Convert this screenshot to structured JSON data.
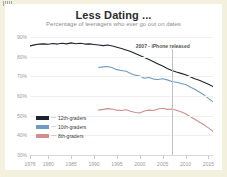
{
  "page": {
    "background": "#f3f1dd",
    "card_background": "#ffffff"
  },
  "header": {
    "title": "Less Dating ...",
    "subtitle": "Percentage of teenagers who ever go out on dates"
  },
  "annotation": {
    "text": "2007 - iPhone released",
    "year": 2007
  },
  "legend": {
    "dash": "—",
    "items": [
      {
        "label": "12th-graders",
        "color": "#1c2230"
      },
      {
        "label": "10th-graders",
        "color": "#6f9cc0"
      },
      {
        "label": "8th-graders",
        "color": "#cf8f8a"
      }
    ]
  },
  "chart_data": {
    "type": "line",
    "title": "Less Dating ...",
    "subtitle": "Percentage of teenagers who ever go out on dates",
    "xlabel": "",
    "ylabel": "",
    "xlim": [
      1976,
      2016
    ],
    "ylim": [
      30,
      90
    ],
    "grid": true,
    "legend_position": "inside-lower-left",
    "ytick_labels": [
      "90%",
      "80%",
      "70%",
      "60%",
      "50%",
      "40%",
      "30%"
    ],
    "ytick_values": [
      90,
      80,
      70,
      60,
      50,
      40,
      30
    ],
    "xtick_labels": [
      "1976",
      "1980",
      "1985",
      "1990",
      "1995",
      "2000",
      "2005",
      "2010",
      "2015"
    ],
    "xtick_values": [
      1976,
      1980,
      1985,
      1990,
      1995,
      2000,
      2005,
      2010,
      2015
    ],
    "annotations": [
      {
        "text": "2007 - iPhone released",
        "x": 2007,
        "type": "vline"
      }
    ],
    "series": [
      {
        "name": "12th-graders",
        "color": "#1c2230",
        "x": [
          1976,
          1977,
          1978,
          1979,
          1980,
          1981,
          1982,
          1983,
          1984,
          1985,
          1986,
          1987,
          1988,
          1989,
          1990,
          1991,
          1992,
          1993,
          1994,
          1995,
          1996,
          1997,
          1998,
          1999,
          2000,
          2001,
          2002,
          2003,
          2004,
          2005,
          2006,
          2007,
          2008,
          2009,
          2010,
          2011,
          2012,
          2013,
          2014,
          2015,
          2016
        ],
        "values": [
          85.5,
          86.0,
          86.4,
          86.5,
          86.3,
          86.7,
          86.4,
          86.8,
          86.5,
          87.0,
          86.6,
          86.8,
          86.4,
          86.5,
          86.2,
          85.9,
          85.6,
          85.9,
          85.4,
          84.8,
          84.2,
          83.4,
          82.6,
          81.6,
          80.6,
          79.6,
          78.5,
          77.4,
          76.3,
          75.2,
          74.0,
          73.0,
          72.2,
          71.5,
          70.8,
          69.8,
          68.8,
          68.0,
          67.0,
          66.0,
          64.8
        ]
      },
      {
        "name": "10th-graders",
        "color": "#6f9cc0",
        "x": [
          1991,
          1992,
          1993,
          1994,
          1995,
          1996,
          1997,
          1998,
          1999,
          2000,
          2001,
          2002,
          2003,
          2004,
          2005,
          2006,
          2007,
          2008,
          2009,
          2010,
          2011,
          2012,
          2013,
          2014,
          2015,
          2016
        ],
        "values": [
          74.5,
          74.8,
          75.0,
          74.4,
          73.4,
          73.0,
          72.6,
          71.4,
          70.6,
          70.2,
          69.0,
          69.4,
          68.6,
          68.4,
          68.8,
          68.2,
          67.4,
          67.0,
          66.4,
          65.8,
          64.6,
          63.4,
          62.0,
          60.6,
          58.8,
          57.0
        ]
      },
      {
        "name": "8th-graders",
        "color": "#cf8f8a",
        "x": [
          1991,
          1992,
          1993,
          1994,
          1995,
          1996,
          1997,
          1998,
          1999,
          2000,
          2001,
          2002,
          2003,
          2004,
          2005,
          2006,
          2007,
          2008,
          2009,
          2010,
          2011,
          2012,
          2013,
          2014,
          2015,
          2016
        ],
        "values": [
          52.8,
          53.2,
          53.6,
          53.4,
          52.8,
          52.6,
          53.0,
          52.2,
          51.6,
          51.4,
          52.4,
          52.8,
          52.6,
          53.4,
          53.8,
          53.2,
          53.4,
          52.8,
          52.0,
          51.0,
          49.6,
          48.2,
          46.8,
          45.4,
          43.8,
          42.0
        ]
      }
    ]
  }
}
